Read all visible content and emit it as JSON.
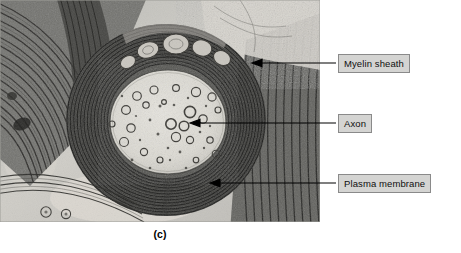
{
  "figure": {
    "caption": "(c)",
    "image_kind": "transmission-electron-micrograph"
  },
  "labels": [
    {
      "id": "myelin",
      "text": "Myelin sheath",
      "box": {
        "x": 338,
        "y": 54,
        "w": 95,
        "h": 19
      },
      "leader": {
        "x1": 336,
        "y1": 63,
        "x2": 258,
        "y2": 63,
        "arrow": true
      }
    },
    {
      "id": "axon",
      "text": "Axon",
      "box": {
        "x": 338,
        "y": 114,
        "w": 41,
        "h": 19
      },
      "leader": {
        "x1": 336,
        "y1": 123,
        "x2": 196,
        "y2": 123,
        "arrow": true
      }
    },
    {
      "id": "plasma",
      "text": "Plasma membrane",
      "box": {
        "x": 338,
        "y": 174,
        "w": 105,
        "h": 19
      },
      "leader": {
        "x1": 336,
        "y1": 183,
        "x2": 214,
        "y2": 183,
        "arrow": true
      }
    }
  ],
  "colors": {
    "box_fill": "#d4d4d2",
    "box_border": "#8a8a8a",
    "leader_line": "#000000",
    "micrograph_background": "#c9c9c5",
    "axoplasm": "#dedcd6",
    "myelin_dark": "#2a2a28",
    "page_background": "#ffffff"
  },
  "micrograph": {
    "bounds": {
      "x": 0,
      "y": 0,
      "w": 320,
      "h": 222
    },
    "structures": [
      {
        "name": "axon",
        "shape": "ellipse",
        "cx": 168,
        "cy": 122,
        "rx": 58,
        "ry": 52
      },
      {
        "name": "myelin-sheath",
        "shape": "annulus",
        "cx": 166,
        "cy": 120,
        "rx": 100,
        "ry": 96,
        "lamellae": 26
      },
      {
        "name": "plasma-membrane",
        "shape": "arc",
        "cx": 168,
        "cy": 122,
        "rx": 59,
        "ry": 53
      },
      {
        "name": "adjacent-fiber-upper-left",
        "shape": "lamellar-band"
      },
      {
        "name": "adjacent-fiber-lower-left",
        "shape": "lamellar-band"
      },
      {
        "name": "adjacent-fiber-right",
        "shape": "lamellar-band"
      }
    ]
  }
}
